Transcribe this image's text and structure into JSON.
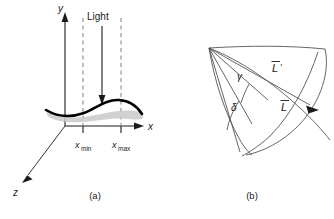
{
  "figure": {
    "type": "scientific-diagram",
    "panel_count": 2,
    "background_color": "#ffffff",
    "line_color": "#1a1a1a",
    "curve_color": "#000000",
    "shadow_color": "#c9c9c9",
    "dash_color": "#8a8a8a",
    "thin_line_color": "#555555"
  },
  "panel_a": {
    "caption": "(a)",
    "axes": {
      "y_label": "y",
      "x_label": "x",
      "z_label": "z"
    },
    "light": {
      "label": "Light",
      "direction": "downward"
    },
    "ticks": [
      {
        "base": "x",
        "sub": "min"
      },
      {
        "base": "x",
        "sub": "max"
      }
    ],
    "surface": {
      "description": "wavy-profile-curve",
      "has_shadow": true
    }
  },
  "panel_b": {
    "caption": "(b)",
    "angles": [
      {
        "symbol": "γ",
        "name": "gamma"
      },
      {
        "symbol": "δ",
        "name": "delta"
      }
    ],
    "vectors": [
      {
        "base": "L",
        "overbar": true,
        "prime": true,
        "display": "L̄′"
      },
      {
        "base": "L",
        "overbar": true,
        "prime": false,
        "display": "L̄"
      }
    ]
  }
}
